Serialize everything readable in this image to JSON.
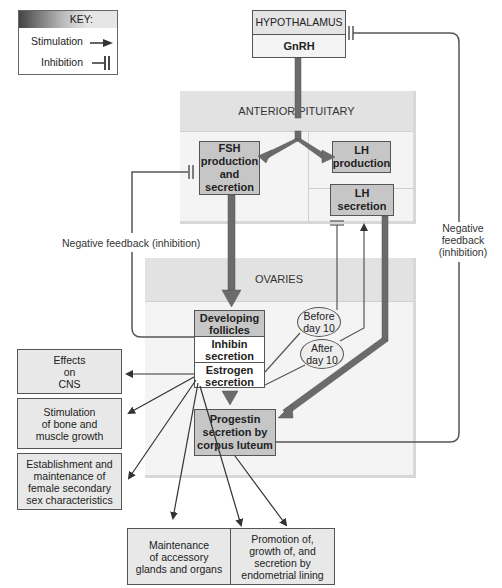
{
  "key": {
    "title": "KEY:",
    "stimulation": "Stimulation",
    "inhibition": "Inhibition"
  },
  "hypothalamus": {
    "title": "HYPOTHALAMUS",
    "hormone": "GnRH"
  },
  "anterior_pituitary": {
    "title": "ANTERIOR PITUITARY",
    "fsh": "FSH\nproduction\nand\nsecretion",
    "lh_production": "LH\nproduction",
    "lh_secretion": "LH\nsecretion"
  },
  "ovaries": {
    "title": "OVARIES",
    "developing_follicles": "Developing\nfollicles",
    "inhibin": "Inhibin\nsecretion",
    "estrogen": "Estrogen\nsecretion",
    "progestin": "Progestin\nsecretion by\ncorpus luteum",
    "before_day10": "Before\nday 10",
    "after_day10": "After\nday 10"
  },
  "feedback": {
    "left": "Negative feedback (inhibition)",
    "right": "Negative\nfeedback\n(inhibition)"
  },
  "effects": {
    "cns": "Effects\non\nCNS",
    "bone": "Stimulation\nof bone and\nmuscle growth",
    "sex": "Establishment and\nmaintenance of\nfemale secondary\nsex characteristics",
    "glands": "Maintenance\nof accessory\nglands and organs",
    "endometrial": "Promotion of,\ngrowth of, and\nsecretion by\nendometrial lining"
  },
  "colors": {
    "arrow_thick": "#6b6b6b",
    "line": "#555555",
    "box_dark": "#c6c6c6",
    "box_light": "#e8e8e8",
    "region": "#ececec"
  }
}
